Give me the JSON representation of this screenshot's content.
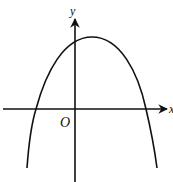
{
  "figure": {
    "labels": {
      "y_axis": "y",
      "x_axis": "x",
      "origin": "O"
    },
    "curve": {
      "type": "parabola",
      "opens": "down",
      "vertex_position": "right of y-axis, above x-axis",
      "y_intercept": "positive",
      "x_intercepts": "one negative, one positive"
    },
    "colors": {
      "stroke": "#111111",
      "background": "#ffffff"
    }
  }
}
